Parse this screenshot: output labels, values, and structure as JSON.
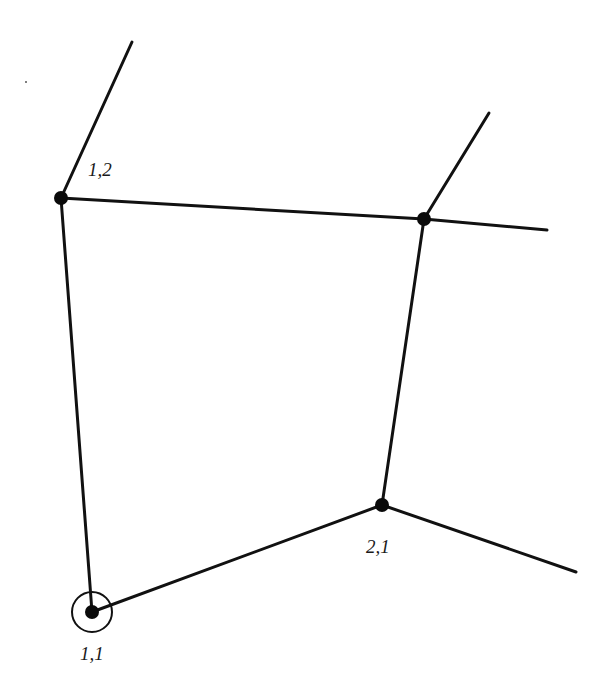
{
  "diagram": {
    "type": "graph-fragment",
    "background": "#ffffff",
    "stroke_color": "#111111",
    "nodes": [
      {
        "id": "n11",
        "label": "1,1",
        "x": 92,
        "y": 612,
        "marked": true
      },
      {
        "id": "n21",
        "label": "2,1",
        "x": 382,
        "y": 505,
        "marked": false
      },
      {
        "id": "n12",
        "label": "1,2",
        "x": 61,
        "y": 198,
        "marked": false
      },
      {
        "id": "n22",
        "label": "",
        "x": 424,
        "y": 219,
        "marked": false
      }
    ],
    "edges": [
      {
        "from": "n11",
        "to": "n12"
      },
      {
        "from": "n11",
        "to": "n21"
      },
      {
        "from": "n12",
        "to": "n22"
      },
      {
        "from": "n21",
        "to": "n22"
      }
    ],
    "dangling_edges": [
      {
        "from": "n12",
        "to_x": 132,
        "to_y": 42
      },
      {
        "from": "n22",
        "to_x": 489,
        "to_y": 113
      },
      {
        "from": "n22",
        "to_x": 547,
        "to_y": 230
      },
      {
        "from": "n21",
        "to_x": 576,
        "to_y": 572
      }
    ],
    "labels": {
      "n11": "1,1",
      "n21": "2,1",
      "n12": "1,2"
    }
  }
}
